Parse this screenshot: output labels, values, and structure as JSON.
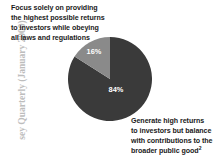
{
  "figure": {
    "source_credit": "sey Quarterly (January 2000)"
  },
  "callouts": {
    "small_slice": {
      "lines": [
        "Focus solely on providing",
        "the highest possible returns",
        "to investors while obeying",
        "all laws and regulations"
      ]
    },
    "large_slice": {
      "lines": [
        "Generate high returns",
        "to investors but balance",
        "with contributions to the",
        "broader public good"
      ],
      "footnote_marker": "2"
    }
  },
  "chart_data": {
    "type": "pie",
    "title": "",
    "categories": [
      "Generate high returns to investors but balance with contributions to the broader public good",
      "Focus solely on providing the highest possible returns to investors while obeying all laws and regulations"
    ],
    "values": [
      84,
      16
    ],
    "value_labels": [
      "84%",
      "16%"
    ],
    "colors": [
      "#3a3a3a",
      "#8a8a8a"
    ],
    "unit": "%",
    "start_angle_deg": 0,
    "direction": "counterclockwise",
    "legend": "none",
    "grid": false,
    "slices": [
      {
        "label": "Generate high returns to investors but balance with contributions to the broader public good",
        "value": 84,
        "display": "84%",
        "color": "#3a3a3a",
        "label_x": 48,
        "label_y": 55
      },
      {
        "label": "Focus solely on providing the highest possible returns to investors while obeying all laws and regulations",
        "value": 16,
        "display": "16%",
        "color": "#8a8a8a",
        "label_x": 26,
        "label_y": 17
      }
    ]
  }
}
